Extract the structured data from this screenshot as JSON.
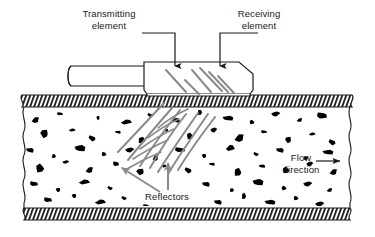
{
  "figure": {
    "labels": {
      "transmitting": "Transmitting\nelement",
      "receiving": "Receiving\nelement",
      "flow": "Flow\ndirection",
      "reflectors": "Reflectors"
    },
    "icons": {
      "flow_arrow": "arrow-right-icon",
      "transmitting_leader": "arrow-down-icon",
      "receiving_leader": "arrow-down-icon",
      "reflector_pointer_left": "arrow-up-left-icon",
      "reflector_pointer_right": "arrow-up-icon"
    },
    "colors": {
      "outline": "#1a1a1a",
      "beam": "#8a8a8a",
      "pointer": "#8a8a8a",
      "particle": "#000000",
      "background": "#ffffff",
      "wall_hatch": "#1a1a1a"
    },
    "components": {
      "pipe_wall_top": "hatched pipe wall",
      "pipe_wall_bottom": "hatched pipe wall",
      "fluid": "fluid with suspended reflector particles",
      "transducer": "transducer housing block",
      "cable": "signal cable"
    }
  },
  "chart_data": {
    "type": "diagram",
    "particles": [
      [
        36,
        120,
        4,
        3
      ],
      [
        60,
        114,
        3,
        2
      ],
      [
        98,
        118,
        2,
        2
      ],
      [
        126,
        122,
        5,
        3
      ],
      [
        150,
        115,
        3,
        2
      ],
      [
        176,
        120,
        4,
        3
      ],
      [
        200,
        112,
        3,
        3
      ],
      [
        228,
        118,
        5,
        3
      ],
      [
        252,
        122,
        3,
        2
      ],
      [
        276,
        114,
        4,
        3
      ],
      [
        300,
        120,
        3,
        2
      ],
      [
        322,
        116,
        5,
        4
      ],
      [
        44,
        134,
        5,
        4
      ],
      [
        72,
        130,
        3,
        2
      ],
      [
        92,
        138,
        4,
        3
      ],
      [
        118,
        132,
        3,
        2
      ],
      [
        142,
        140,
        5,
        3
      ],
      [
        166,
        130,
        2,
        2
      ],
      [
        190,
        136,
        4,
        3
      ],
      [
        214,
        130,
        3,
        3
      ],
      [
        240,
        138,
        5,
        4
      ],
      [
        264,
        132,
        3,
        2
      ],
      [
        288,
        140,
        4,
        3
      ],
      [
        312,
        134,
        3,
        2
      ],
      [
        332,
        142,
        4,
        3
      ],
      [
        30,
        150,
        4,
        3
      ],
      [
        54,
        156,
        3,
        2
      ],
      [
        80,
        148,
        5,
        4
      ],
      [
        104,
        154,
        3,
        2
      ],
      [
        130,
        150,
        4,
        3
      ],
      [
        156,
        158,
        3,
        3
      ],
      [
        180,
        150,
        5,
        3
      ],
      [
        204,
        156,
        3,
        2
      ],
      [
        230,
        148,
        4,
        4
      ],
      [
        256,
        154,
        3,
        2
      ],
      [
        280,
        150,
        4,
        3
      ],
      [
        306,
        158,
        3,
        2
      ],
      [
        328,
        152,
        5,
        3
      ],
      [
        40,
        168,
        5,
        4
      ],
      [
        66,
        162,
        3,
        2
      ],
      [
        90,
        170,
        4,
        3
      ],
      [
        116,
        164,
        3,
        3
      ],
      [
        140,
        172,
        5,
        3
      ],
      [
        164,
        166,
        2,
        2
      ],
      [
        188,
        170,
        4,
        3
      ],
      [
        212,
        164,
        3,
        2
      ],
      [
        238,
        172,
        5,
        4
      ],
      [
        262,
        166,
        3,
        2
      ],
      [
        286,
        170,
        4,
        3
      ],
      [
        310,
        164,
        3,
        3
      ],
      [
        334,
        172,
        4,
        3
      ],
      [
        34,
        184,
        4,
        3
      ],
      [
        58,
        190,
        3,
        2
      ],
      [
        84,
        182,
        5,
        3
      ],
      [
        110,
        188,
        3,
        2
      ],
      [
        206,
        184,
        4,
        3
      ],
      [
        232,
        190,
        3,
        2
      ],
      [
        258,
        182,
        5,
        4
      ],
      [
        284,
        188,
        3,
        2
      ],
      [
        308,
        184,
        4,
        3
      ],
      [
        330,
        190,
        3,
        2
      ],
      [
        48,
        200,
        4,
        3
      ],
      [
        74,
        196,
        3,
        2
      ],
      [
        100,
        202,
        5,
        3
      ],
      [
        124,
        198,
        3,
        2
      ],
      [
        218,
        202,
        4,
        3
      ],
      [
        244,
        196,
        3,
        3
      ],
      [
        270,
        202,
        5,
        3
      ],
      [
        296,
        198,
        3,
        2
      ],
      [
        320,
        204,
        4,
        3
      ],
      [
        50,
        208,
        3,
        2
      ],
      [
        146,
        206,
        3,
        2
      ],
      [
        190,
        208,
        3,
        2
      ],
      [
        254,
        210,
        3,
        2
      ],
      [
        300,
        210,
        3,
        2
      ]
    ],
    "wave_arcs": 7,
    "beam_lines": 6
  }
}
